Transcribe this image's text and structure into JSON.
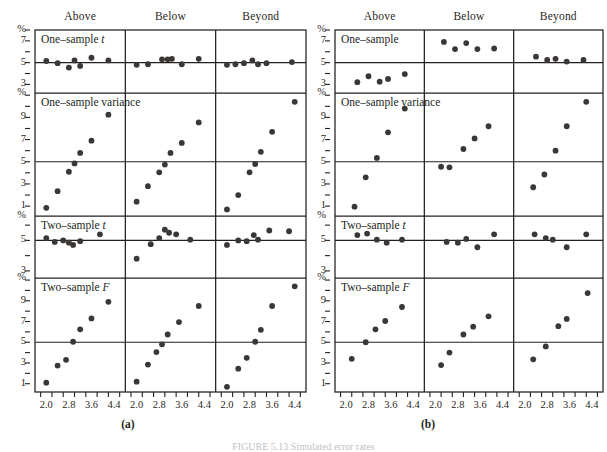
{
  "figure": {
    "caption": "FIGURE 5.13   Simulated error rates",
    "columns": [
      "Above",
      "Below",
      "Beyond"
    ],
    "subfigures": [
      {
        "label": "(a)"
      },
      {
        "label": "(b)"
      }
    ],
    "x_ticks": [
      "2.0",
      "2.8",
      "3.6",
      "4.4"
    ],
    "x_minor_count": 8,
    "x_range": [
      1.6,
      4.8
    ],
    "rows": [
      {
        "title_a": "One–sample t",
        "title_b": "One–sample",
        "y_ticks": [
          "%",
          "7",
          "5",
          "3"
        ],
        "y_axis_label": "%",
        "y_range": [
          2.3,
          8.0
        ],
        "y_tick_values": [
          8.0,
          7,
          5,
          3
        ],
        "reference_value": 5
      },
      {
        "title_a": "One–sample variance",
        "title_b": "One–sample variance",
        "y_ticks": [
          "%",
          "9",
          "7",
          "5",
          "3",
          "1"
        ],
        "y_axis_label": "%",
        "y_range": [
          0.2,
          11.2
        ],
        "y_tick_values": [
          11.2,
          9,
          7,
          5,
          3,
          1
        ],
        "reference_value": 5
      },
      {
        "title_a": "Two–sample t",
        "title_b": "Two–sample t",
        "y_ticks": [
          "%",
          "5",
          "3"
        ],
        "y_axis_label": "%",
        "y_range": [
          2.6,
          6.6
        ],
        "y_tick_values": [
          6.6,
          5,
          3
        ],
        "reference_value": 5
      },
      {
        "title_a": "Two–sample F",
        "title_b": "Two–sample F",
        "y_ticks": [
          "%",
          "9",
          "7",
          "5",
          "3",
          "1"
        ],
        "y_axis_label": "%",
        "y_range": [
          0.2,
          11.2
        ],
        "y_tick_values": [
          11.2,
          9,
          7,
          5,
          3,
          1
        ],
        "reference_value": 5
      }
    ]
  },
  "chart_data": {
    "type": "scatter",
    "title": "FIGURE 5.13   Simulated error rates",
    "xlabel": "",
    "ylabel": "%",
    "grid": false,
    "legend": "none",
    "xlim": [
      1.6,
      4.8
    ],
    "panel_columns": [
      "Above",
      "Below",
      "Beyond"
    ],
    "panel_rows": [
      "One-sample t",
      "One-sample variance",
      "Two-sample t",
      "Two-sample F"
    ],
    "reference_line_y": 5,
    "subfigure_a": {
      "label": "(a)",
      "n_points_per_panel": 7,
      "panels": [
        {
          "row": "One-sample t",
          "column": "Above",
          "ylim": [
            2.3,
            8.0
          ],
          "x": [
            2.0,
            2.4,
            2.8,
            3.0,
            3.2,
            3.6,
            4.2
          ],
          "y": [
            5.15,
            4.95,
            4.55,
            5.2,
            4.7,
            5.45,
            5.2
          ]
        },
        {
          "row": "One-sample t",
          "column": "Below",
          "ylim": [
            2.3,
            8.0
          ],
          "x": [
            2.0,
            2.4,
            2.9,
            3.1,
            3.25,
            3.6,
            4.2
          ],
          "y": [
            4.8,
            4.85,
            5.3,
            5.3,
            5.35,
            4.85,
            5.35
          ]
        },
        {
          "row": "One-sample t",
          "column": "Beyond",
          "ylim": [
            2.3,
            8.0
          ],
          "x": [
            2.0,
            2.3,
            2.6,
            2.9,
            3.1,
            3.4,
            4.3
          ],
          "y": [
            4.8,
            4.85,
            4.95,
            5.2,
            4.85,
            4.95,
            5.05
          ]
        },
        {
          "row": "One-sample variance",
          "column": "Above",
          "ylim": [
            0.2,
            11.2
          ],
          "x": [
            2.0,
            2.4,
            2.8,
            3.0,
            3.2,
            3.6,
            4.2
          ],
          "y": [
            0.85,
            2.35,
            4.1,
            4.85,
            5.8,
            6.9,
            9.25
          ]
        },
        {
          "row": "One-sample variance",
          "column": "Below",
          "ylim": [
            0.2,
            11.2
          ],
          "x": [
            2.0,
            2.4,
            2.8,
            3.0,
            3.2,
            3.6,
            4.2
          ],
          "y": [
            1.4,
            2.8,
            4.05,
            4.75,
            5.8,
            6.7,
            8.55
          ]
        },
        {
          "row": "One-sample variance",
          "column": "Beyond",
          "ylim": [
            0.2,
            11.2
          ],
          "x": [
            2.0,
            2.4,
            2.8,
            3.0,
            3.2,
            3.6,
            4.4
          ],
          "y": [
            0.7,
            2.0,
            4.05,
            4.8,
            5.9,
            7.7,
            10.4
          ]
        },
        {
          "row": "Two-sample t",
          "column": "Above",
          "ylim": [
            2.6,
            6.6
          ],
          "x": [
            2.0,
            2.3,
            2.6,
            2.8,
            2.95,
            3.2,
            3.9
          ],
          "y": [
            5.15,
            4.9,
            5.0,
            4.85,
            4.7,
            4.95,
            5.4
          ]
        },
        {
          "row": "Two-sample t",
          "column": "Below",
          "ylim": [
            2.6,
            6.6
          ],
          "x": [
            2.0,
            2.5,
            2.8,
            3.0,
            3.15,
            3.4,
            3.9
          ],
          "y": [
            3.8,
            4.75,
            5.15,
            5.7,
            5.5,
            5.4,
            5.05
          ]
        },
        {
          "row": "Two-sample t",
          "column": "Beyond",
          "ylim": [
            2.6,
            6.6
          ],
          "x": [
            2.0,
            2.4,
            2.7,
            2.95,
            3.1,
            3.5,
            4.2
          ],
          "y": [
            4.7,
            5.0,
            4.95,
            5.35,
            5.05,
            5.65,
            5.6
          ]
        },
        {
          "row": "Two-sample F",
          "column": "Above",
          "ylim": [
            0.2,
            11.2
          ],
          "x": [
            2.0,
            2.4,
            2.7,
            2.95,
            3.2,
            3.6,
            4.2
          ],
          "y": [
            1.1,
            2.75,
            3.3,
            5.05,
            6.25,
            7.3,
            8.9
          ]
        },
        {
          "row": "Two-sample F",
          "column": "Below",
          "ylim": [
            0.2,
            11.2
          ],
          "x": [
            2.0,
            2.4,
            2.7,
            2.9,
            3.1,
            3.5,
            4.2
          ],
          "y": [
            1.2,
            2.85,
            4.05,
            4.8,
            5.75,
            6.95,
            8.5
          ]
        },
        {
          "row": "Two-sample F",
          "column": "Beyond",
          "ylim": [
            0.2,
            11.2
          ],
          "x": [
            2.0,
            2.4,
            2.7,
            3.0,
            3.2,
            3.6,
            4.4
          ],
          "y": [
            0.7,
            2.45,
            3.5,
            5.05,
            6.2,
            8.5,
            10.4
          ]
        }
      ]
    },
    "subfigure_b": {
      "label": "(b)",
      "n_points_per_panel": 5,
      "panels": [
        {
          "row": "One-sample",
          "column": "Above",
          "ylim": [
            2.3,
            8.0
          ],
          "x": [
            2.4,
            2.8,
            3.2,
            3.5,
            4.1
          ],
          "y": [
            3.2,
            3.75,
            3.25,
            3.5,
            3.95
          ]
        },
        {
          "row": "One-sample",
          "column": "Below",
          "ylim": [
            2.3,
            8.0
          ],
          "x": [
            2.3,
            2.7,
            3.1,
            3.5,
            4.1
          ],
          "y": [
            6.9,
            6.25,
            6.8,
            6.25,
            6.3
          ]
        },
        {
          "row": "One-sample",
          "column": "Beyond",
          "ylim": [
            2.3,
            8.0
          ],
          "x": [
            2.4,
            2.8,
            3.1,
            3.5,
            4.1
          ],
          "y": [
            5.55,
            5.25,
            5.35,
            5.1,
            5.25
          ]
        },
        {
          "row": "One-sample variance",
          "column": "Above",
          "ylim": [
            0.2,
            11.2
          ],
          "x": [
            2.3,
            2.7,
            3.1,
            3.5,
            4.1
          ],
          "y": [
            0.95,
            3.6,
            5.35,
            7.65,
            9.8
          ]
        },
        {
          "row": "One-sample variance",
          "column": "Below",
          "ylim": [
            0.2,
            11.2
          ],
          "x": [
            2.2,
            2.5,
            3.0,
            3.4,
            3.9
          ],
          "y": [
            4.55,
            4.5,
            6.15,
            7.1,
            8.2
          ]
        },
        {
          "row": "One-sample variance",
          "column": "Beyond",
          "ylim": [
            0.2,
            11.2
          ],
          "x": [
            2.3,
            2.7,
            3.1,
            3.5,
            4.2
          ],
          "y": [
            2.7,
            3.85,
            6.0,
            8.2,
            10.4
          ]
        },
        {
          "row": "Two-sample t",
          "column": "Above",
          "ylim": [
            2.6,
            6.6
          ],
          "x": [
            2.4,
            2.75,
            3.1,
            3.45,
            4.0
          ],
          "y": [
            5.35,
            5.45,
            5.05,
            4.85,
            5.05
          ]
        },
        {
          "row": "Two-sample t",
          "column": "Below",
          "ylim": [
            2.6,
            6.6
          ],
          "x": [
            2.4,
            2.8,
            3.1,
            3.5,
            4.1
          ],
          "y": [
            4.9,
            4.85,
            5.1,
            4.55,
            5.4
          ]
        },
        {
          "row": "Two-sample t",
          "column": "Beyond",
          "ylim": [
            2.6,
            6.6
          ],
          "x": [
            2.35,
            2.75,
            3.0,
            3.5,
            4.2
          ],
          "y": [
            5.4,
            5.15,
            5.05,
            4.55,
            5.4
          ]
        },
        {
          "row": "Two-sample F",
          "column": "Above",
          "ylim": [
            0.2,
            11.2
          ],
          "x": [
            2.2,
            2.7,
            3.05,
            3.4,
            4.0
          ],
          "y": [
            3.4,
            5.0,
            6.25,
            7.05,
            8.4
          ]
        },
        {
          "row": "Two-sample F",
          "column": "Below",
          "ylim": [
            0.2,
            11.2
          ],
          "x": [
            2.2,
            2.5,
            3.0,
            3.35,
            3.9
          ],
          "y": [
            2.8,
            4.0,
            5.75,
            6.5,
            7.5
          ]
        },
        {
          "row": "Two-sample F",
          "column": "Beyond",
          "ylim": [
            0.2,
            11.2
          ],
          "x": [
            2.3,
            2.75,
            3.2,
            3.5,
            4.25
          ],
          "y": [
            3.35,
            4.6,
            6.55,
            7.25,
            9.75
          ]
        }
      ]
    }
  }
}
